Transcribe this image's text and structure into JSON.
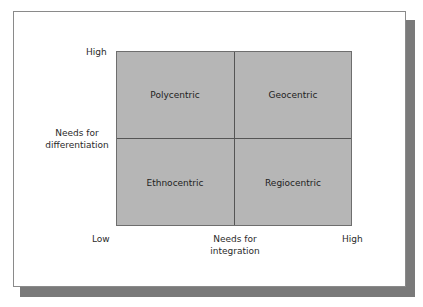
{
  "diagram": {
    "type": "2x2-matrix",
    "quadrants": {
      "top_left": "Polycentric",
      "top_right": "Geocentric",
      "bottom_left": "Ethnocentric",
      "bottom_right": "Regiocentric"
    },
    "y_axis": {
      "title_line1": "Needs for",
      "title_line2": "differentiation",
      "high_label": "High"
    },
    "x_axis": {
      "title_line1": "Needs for",
      "title_line2": "integration",
      "low_label": "Low",
      "high_label": "High"
    },
    "colors": {
      "quadrant_fill": "#b6b6b6",
      "divider": "#555555",
      "shadow": "#7a7a7a",
      "frame_border": "#8a8a8a"
    }
  }
}
